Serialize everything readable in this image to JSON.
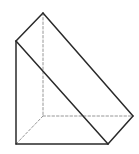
{
  "diagram": {
    "type": "triangular-prism",
    "colors": {
      "stroke": "#2a2a2a",
      "hidden_stroke": "#8a8a8a",
      "background": "#ffffff"
    },
    "vertices": {
      "A_top_back": [
        43,
        13
      ],
      "B_top_front_left": [
        16,
        41
      ],
      "C_bottom_front_left": [
        16,
        144
      ],
      "D_bottom_front_right": [
        108,
        144
      ],
      "E_bottom_back_right": [
        133,
        116
      ],
      "F_bottom_back_left": [
        43,
        116
      ]
    },
    "visible_edges": [
      [
        "A_top_back",
        "B_top_front_left"
      ],
      [
        "A_top_back",
        "E_bottom_back_right"
      ],
      [
        "B_top_front_left",
        "C_bottom_front_left"
      ],
      [
        "B_top_front_left",
        "D_bottom_front_right"
      ],
      [
        "C_bottom_front_left",
        "D_bottom_front_right"
      ],
      [
        "D_bottom_front_right",
        "E_bottom_back_right"
      ]
    ],
    "hidden_edges": [
      [
        "A_top_back",
        "F_bottom_back_left"
      ],
      [
        "F_bottom_back_left",
        "E_bottom_back_right"
      ],
      [
        "F_bottom_back_left",
        "C_bottom_front_left"
      ]
    ]
  }
}
